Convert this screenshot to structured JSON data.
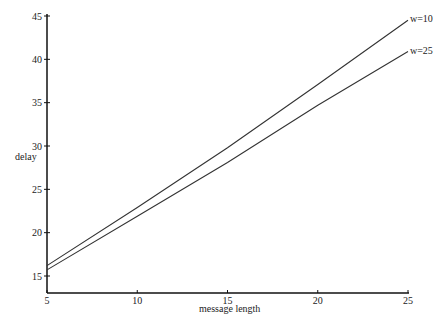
{
  "chart_data": {
    "type": "line",
    "title": "",
    "xlabel": "message length",
    "ylabel": "delay",
    "x": [
      5,
      10,
      15,
      20,
      25
    ],
    "series": [
      {
        "name": "w=10",
        "values": [
          16.2,
          22.9,
          29.8,
          37.1,
          44.5
        ]
      },
      {
        "name": "w=25",
        "values": [
          15.7,
          21.9,
          28.1,
          34.7,
          40.9
        ]
      }
    ],
    "xlim": [
      5,
      25
    ],
    "ylim": [
      13,
      45
    ],
    "xticks": [
      "5",
      "10",
      "15",
      "20",
      "25"
    ],
    "yticks": [
      "15",
      "20",
      "25",
      "30",
      "35",
      "40",
      "45"
    ],
    "grid": false,
    "legend_position": "inline-right-end"
  }
}
